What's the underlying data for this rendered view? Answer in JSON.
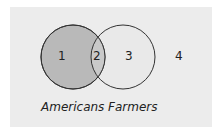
{
  "diagram": {
    "type": "venn",
    "background_color": "#ececec",
    "sets": [
      {
        "name": "Americans",
        "fill": "#b9b9b9",
        "stroke": "#333333"
      },
      {
        "name": "Farmers",
        "fill": "#e9e9e9",
        "stroke": "#333333"
      }
    ],
    "intersection_fill": "#c9c9c9",
    "regions": [
      {
        "id": "1",
        "label": "1",
        "description": "Americans only"
      },
      {
        "id": "2",
        "label": "2",
        "description": "Americans and Farmers"
      },
      {
        "id": "3",
        "label": "3",
        "description": "Farmers only"
      },
      {
        "id": "4",
        "label": "4",
        "description": "Neither"
      }
    ]
  }
}
